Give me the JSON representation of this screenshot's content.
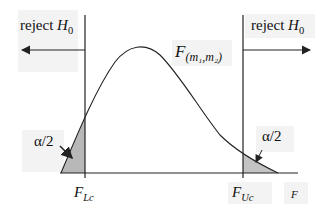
{
  "diagram": {
    "title": "",
    "left_region": {
      "label": "reject",
      "hypothesis": "H",
      "hypothesis_sub": "0"
    },
    "right_region": {
      "label": "reject",
      "hypothesis": "H",
      "hypothesis_sub": "0"
    },
    "curve_label": {
      "main": "F",
      "sub": "(m₁,m₂)"
    },
    "left_tail": {
      "label": "α/2"
    },
    "right_tail": {
      "label": "α/2"
    },
    "lower_critical": {
      "main": "F",
      "sub": "Lc"
    },
    "upper_critical": {
      "main": "F",
      "sub": "Uc"
    },
    "axis_label": "F",
    "colors": {
      "line": "#222222",
      "shade": "#b8b8b8",
      "label_bg": "#f2f2f2"
    }
  }
}
